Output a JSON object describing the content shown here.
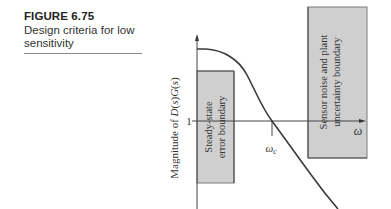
{
  "caption": {
    "figure_number": "FIGURE 6.75",
    "title": "Design criteria for low sensitivity"
  },
  "figure": {
    "y_axis_label": "Magnitude of D(s)G(s)",
    "y_axis_label_parts": {
      "prefix": "Magnitude of ",
      "D": "D",
      "s1": "s",
      "G": "G",
      "s2": "s"
    },
    "y_tick_label": "1",
    "x_axis_label": "ω",
    "crossover_label": {
      "symbol": "ω",
      "subscript": "c"
    },
    "left_region_label": [
      "Steady-state",
      "error boundary"
    ],
    "right_region_label": [
      "Sensor noise and plant",
      "uncertainty boundary"
    ],
    "colors": {
      "region_fill": "#cfcfcf",
      "region_stroke": "#666666",
      "curve": "#3a3a3a",
      "axis": "#444444"
    }
  }
}
